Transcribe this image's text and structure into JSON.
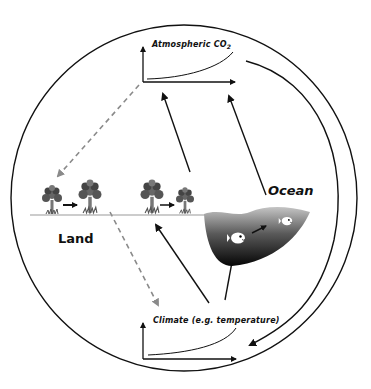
{
  "diagram": {
    "labels": {
      "atmospheric_co2": "Atmospheric CO",
      "co2_subscript": "2",
      "climate": "Climate (e.g. temperature)",
      "land": "Land",
      "ocean": "Ocean"
    },
    "colors": {
      "line": "#111111",
      "dashed": "#8a8a8a",
      "ground": "#999999",
      "ocean_top": "#b8b8b8",
      "ocean_bottom": "#0a0a0a",
      "tree": "#555555"
    },
    "icons": [
      "tree-icon",
      "fish-icon",
      "arrow-icon",
      "graph-axes-icon"
    ]
  }
}
